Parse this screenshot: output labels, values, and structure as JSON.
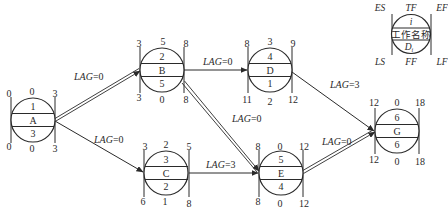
{
  "diagram": {
    "type": "single-code network diagram (precedence network) with time parameters",
    "legend": {
      "top_labels": [
        "ES",
        "TF",
        "EF"
      ],
      "bottom_labels": [
        "LS",
        "FF",
        "LF"
      ],
      "node_id": "i",
      "node_name": "工作名称",
      "duration": "D",
      "duration_subscript": "i"
    },
    "nodes": [
      {
        "id": "1",
        "name": "A",
        "duration": "3",
        "ES": "0",
        "TF": "0",
        "EF": "3",
        "LS": "0",
        "FF": "0",
        "LF": "3"
      },
      {
        "id": "2",
        "name": "B",
        "duration": "5",
        "ES": "3",
        "TF": "5",
        "EF": "8",
        "LS": "3",
        "FF": "0",
        "LF": "8"
      },
      {
        "id": "3",
        "name": "C",
        "duration": "2",
        "ES": "3",
        "TF": "2",
        "EF": "5",
        "LS": "6",
        "FF": "1",
        "LF": "8"
      },
      {
        "id": "4",
        "name": "D",
        "duration": "1",
        "ES": "8",
        "TF": "3",
        "EF": "9",
        "LS": "11",
        "FF": "2",
        "LF": "12"
      },
      {
        "id": "5",
        "name": "E",
        "duration": "4",
        "ES": "8",
        "TF": "0",
        "EF": "12",
        "LS": "8",
        "FF": "0",
        "LF": "12"
      },
      {
        "id": "6",
        "name": "G",
        "duration": "6",
        "ES": "12",
        "TF": "0",
        "EF": "18",
        "LS": "12",
        "FF": "0",
        "LF": "18"
      }
    ],
    "links": [
      {
        "from": "A",
        "to": "B",
        "lag_label": "LAG",
        "lag_value": "=0",
        "critical": true
      },
      {
        "from": "A",
        "to": "C",
        "lag_label": "LAG",
        "lag_value": "=0",
        "critical": false
      },
      {
        "from": "B",
        "to": "D",
        "lag_label": "LAG",
        "lag_value": "=0",
        "critical": false
      },
      {
        "from": "B",
        "to": "E",
        "lag_label": "LAG",
        "lag_value": "=0",
        "critical": true
      },
      {
        "from": "C",
        "to": "E",
        "lag_label": "LAG",
        "lag_value": "=3",
        "critical": false
      },
      {
        "from": "D",
        "to": "G",
        "lag_label": "LAG",
        "lag_value": "=3",
        "critical": false
      },
      {
        "from": "E",
        "to": "G",
        "lag_label": "LAG",
        "lag_value": "=0",
        "critical": true
      }
    ]
  }
}
